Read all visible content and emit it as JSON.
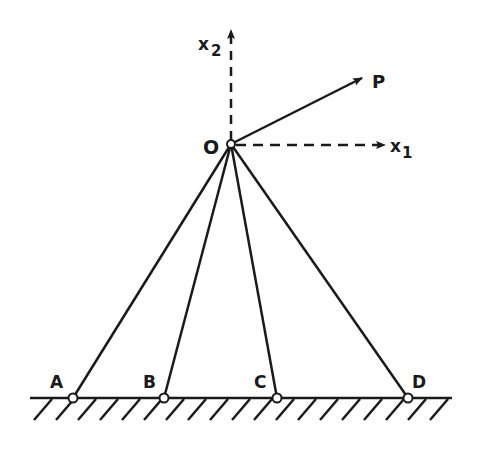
{
  "figure": {
    "type": "truss-diagram",
    "stroke_color": "#1a1a1a",
    "background": "#ffffff"
  },
  "labels": {
    "origin": "O",
    "x1_axis": "x",
    "x1_sub": "1",
    "x2_axis": "x",
    "x2_sub": "2",
    "force": "P",
    "support_a": "A",
    "support_b": "B",
    "support_c": "C",
    "support_d": "D"
  },
  "geometry": {
    "origin": [
      231,
      144
    ],
    "supports": [
      {
        "name": "A",
        "x": 73,
        "y": 398
      },
      {
        "name": "B",
        "x": 164,
        "y": 398
      },
      {
        "name": "C",
        "x": 277,
        "y": 398
      },
      {
        "name": "D",
        "x": 408,
        "y": 398
      }
    ],
    "ground_y": 398,
    "ground_x_range": [
      30,
      452
    ],
    "force_tip": [
      362,
      78
    ]
  }
}
